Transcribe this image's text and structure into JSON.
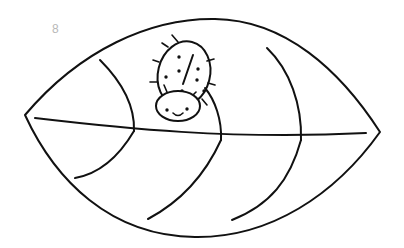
{
  "page": {
    "type": "coloring-page",
    "page_number": "8"
  },
  "colors": {
    "background": "#ffffff",
    "line": "#111111",
    "page_number": "#b8b8b8"
  }
}
